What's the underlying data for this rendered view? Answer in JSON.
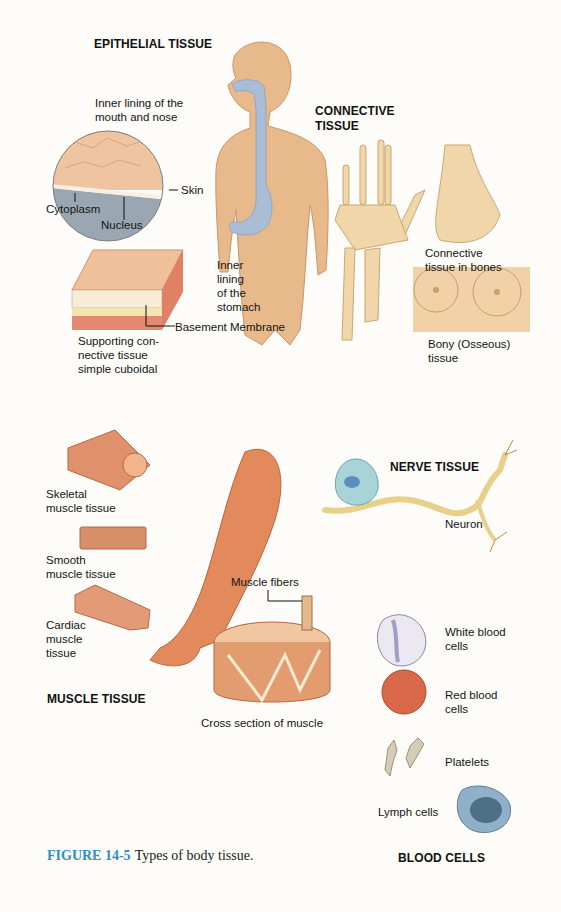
{
  "figure": {
    "number": "FIGURE 14-5",
    "caption": "Types of body tissue."
  },
  "sections": {
    "epithelial": {
      "heading": "EPITHELIAL TISSUE",
      "labels": {
        "mouth_nose": "Inner lining of the\nmouth and nose",
        "skin": "Skin",
        "cytoplasm": "Cytoplasm",
        "nucleus": "Nucleus",
        "stomach": "Inner\nlining\nof the\nstomach",
        "basement": "Basement Membrane",
        "supporting": "Supporting con-\nnective tissue\nsimple cuboidal"
      }
    },
    "connective": {
      "heading": "CONNECTIVE\nTISSUE",
      "labels": {
        "bones": "Connective\ntissue in bones",
        "bony": "Bony (Osseous)\ntissue"
      }
    },
    "nerve": {
      "heading": "NERVE TISSUE",
      "labels": {
        "neuron": "Neuron"
      }
    },
    "muscle": {
      "heading": "MUSCLE TISSUE",
      "labels": {
        "skeletal": "Skeletal\nmuscle tissue",
        "smooth": "Smooth\nmuscle tissue",
        "cardiac": "Cardiac\nmuscle\ntissue",
        "fibers": "Muscle fibers",
        "cross": "Cross section of muscle"
      }
    },
    "blood": {
      "heading": "BLOOD CELLS",
      "labels": {
        "white": "White blood\ncells",
        "red": "Red blood\ncells",
        "platelets": "Platelets",
        "lymph": "Lymph cells"
      }
    }
  },
  "colors": {
    "background": "#fdfcf8",
    "skin": "#e8b98a",
    "airway": "#a9bdd6",
    "bone": "#f0d6a8",
    "muscle": "#e0865a",
    "neuron_body": "#a8d4d8",
    "axon": "#f2dea6",
    "rbc": "#d9694a",
    "wbc": "#e8e4f0",
    "platelet": "#cfc8b4",
    "lymph": "#7d9fb8",
    "figure_label": "#2d8fbf"
  }
}
